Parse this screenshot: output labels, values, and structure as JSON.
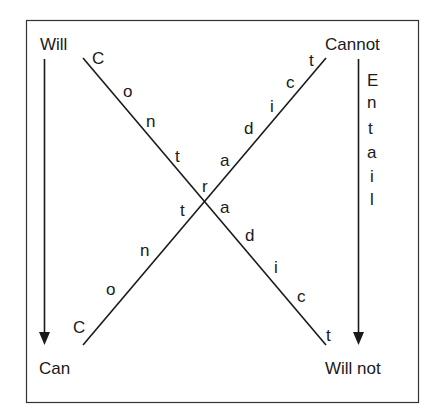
{
  "diagram": {
    "corners": {
      "top_left": "Will",
      "top_right": "Cannot",
      "bottom_left": "Can",
      "bottom_right": "Will not"
    },
    "diagonal_tl_br": {
      "letters": [
        "C",
        "o",
        "n",
        "t",
        "r",
        "a",
        "d",
        "i",
        "c",
        "t"
      ],
      "word": "Contradict"
    },
    "diagonal_bl_tr": {
      "letters": [
        "C",
        "o",
        "n",
        "t",
        "a",
        "d",
        "i",
        "c",
        "t"
      ],
      "word": "Contradict"
    },
    "right_vertical": {
      "letters": [
        "E",
        "n",
        "t",
        "a",
        "i",
        "l"
      ],
      "word": "Entail"
    },
    "colors": {
      "line": "#1a1a1a",
      "frame": "#333333",
      "background": "#ffffff"
    }
  }
}
